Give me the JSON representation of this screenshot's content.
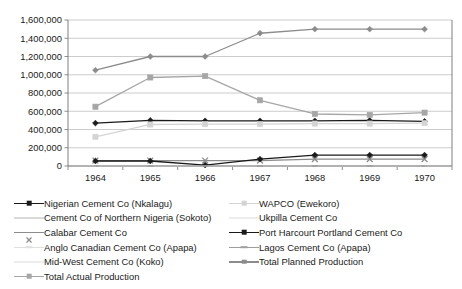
{
  "chart_data": {
    "type": "line",
    "title": "",
    "subtitle": "",
    "xlabel": "",
    "ylabel": "",
    "categories": [
      "1964",
      "1965",
      "1966",
      "1967",
      "1968",
      "1969",
      "1970"
    ],
    "x_tick_labels": [
      "1964",
      "1965",
      "1966",
      "1967",
      "1968",
      "1969",
      "1970"
    ],
    "y_tick_labels": [
      "0",
      "200,000",
      "400,000",
      "600,000",
      "800,000",
      "1,000,000",
      "1,200,000",
      "1,400,000",
      "1,600,000"
    ],
    "y_tick_values": [
      0,
      200000,
      400000,
      600000,
      800000,
      1000000,
      1200000,
      1400000,
      1600000
    ],
    "ylim": [
      0,
      1600000
    ],
    "grid": true,
    "grid_axis": "y",
    "legend_position": "bottom",
    "legend_columns": 2,
    "series": [
      {
        "name": "Nigerian Cement Co (Nkalagu)",
        "values": [
          470000,
          500000,
          495000,
          495000,
          495000,
          500000,
          490000
        ],
        "color": "#1a1a1a",
        "marker": "diamond",
        "legend_column": "left",
        "legend_row": 0
      },
      {
        "name": "Cement Co of Northern Nigeria (Sokoto)",
        "values": [
          0,
          0,
          0,
          0,
          0,
          0,
          0
        ],
        "color": "#d9d9d9",
        "marker": "none",
        "legend_column": "left",
        "legend_row": 1
      },
      {
        "name": "Calabar Cement Co",
        "values": [
          60000,
          60000,
          60000,
          60000,
          75000,
          75000,
          75000
        ],
        "color": "#8c8c8c",
        "marker": "x",
        "legend_column": "left",
        "legend_row": 2
      },
      {
        "name": "Anglo Canadian Cement Co (Apapa)",
        "values": [
          0,
          0,
          0,
          0,
          0,
          0,
          0
        ],
        "color": "#e0e0e0",
        "marker": "dash",
        "legend_column": "left",
        "legend_row": 3
      },
      {
        "name": "Mid-West Cement Co (Koko)",
        "values": [
          0,
          0,
          0,
          0,
          0,
          0,
          0
        ],
        "color": "#ededed",
        "marker": "none",
        "legend_column": "left",
        "legend_row": 4
      },
      {
        "name": "Total Actual Production",
        "values": [
          650000,
          970000,
          985000,
          720000,
          570000,
          560000,
          585000
        ],
        "color": "#a6a6a6",
        "marker": "square",
        "legend_column": "left",
        "legend_row": 5
      },
      {
        "name": "WAPCO (Ewekoro)",
        "values": [
          320000,
          455000,
          460000,
          460000,
          465000,
          465000,
          470000
        ],
        "color": "#d4d4d4",
        "marker": "square",
        "legend_column": "right",
        "legend_row": 0
      },
      {
        "name": "Ukpilla Cement Co",
        "values": [
          0,
          0,
          0,
          0,
          0,
          0,
          0
        ],
        "color": "#ededed",
        "marker": "none",
        "legend_column": "right",
        "legend_row": 1
      },
      {
        "name": "Port Harcourt Portland Cement Co",
        "values": [
          55000,
          55000,
          10000,
          75000,
          120000,
          120000,
          120000
        ],
        "color": "#1a1a1a",
        "marker": "diamond",
        "legend_column": "right",
        "legend_row": 2
      },
      {
        "name": "Lagos Cement Co (Apapa)",
        "values": [
          0,
          0,
          0,
          0,
          0,
          0,
          0
        ],
        "color": "#9e9e9e",
        "marker": "dash",
        "legend_column": "right",
        "legend_row": 3
      },
      {
        "name": "Total Planned Production",
        "values": [
          1050000,
          1200000,
          1200000,
          1455000,
          1500000,
          1500000,
          1500000
        ],
        "color": "#8c8c8c",
        "marker": "diamond",
        "legend_column": "right",
        "legend_row": 4
      }
    ]
  },
  "colors": {
    "axis": "#808080",
    "grid": "#bfbfbf",
    "plot_border": "#808080",
    "background": "#ffffff",
    "text": "#1a1a1a"
  }
}
